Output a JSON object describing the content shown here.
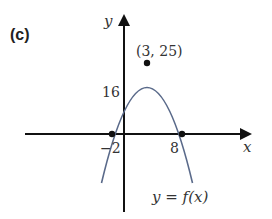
{
  "figure": {
    "part_label": "(c)",
    "x_axis_label": "x",
    "y_axis_label": "y",
    "vertex_label": "(3, 25)",
    "y_intercept_label": "16",
    "x_intercepts": [
      "−2",
      "8"
    ],
    "curve_label": "y = f(x)",
    "curve_color": "#5a6a8a",
    "axis_color": "#111111"
  }
}
